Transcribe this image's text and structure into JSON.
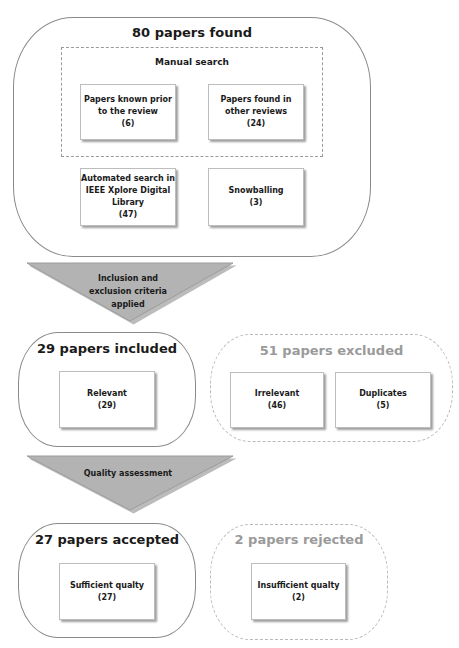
{
  "stage1": {
    "title": "80 papers found",
    "manual_search": {
      "title": "Manual search",
      "items": [
        {
          "line1": "Papers known prior",
          "line2": "to the review",
          "count": "(6)"
        },
        {
          "line1": "Papers found in",
          "line2": "other reviews",
          "count": "(24)"
        }
      ]
    },
    "automated": {
      "line1": "Automated search in",
      "line2": "IEEE Xplore Digital",
      "line3": "Library",
      "count": "(47)"
    },
    "snowballing": {
      "label": "Snowballing",
      "count": "(3)"
    }
  },
  "filter1": {
    "line1": "Inclusion and",
    "line2": "exclusion criteria",
    "line3": "applied"
  },
  "stage2": {
    "included": {
      "title": "29 papers included",
      "items": [
        {
          "label": "Relevant",
          "count": "(29)"
        }
      ]
    },
    "excluded": {
      "title": "51 papers excluded",
      "items": [
        {
          "label": "Irrelevant",
          "count": "(46)"
        },
        {
          "label": "Duplicates",
          "count": "(5)"
        }
      ]
    }
  },
  "filter2": {
    "label": "Quality assessment"
  },
  "stage3": {
    "accepted": {
      "title": "27 papers accepted",
      "items": [
        {
          "label": "Sufficient qualty",
          "count": "(27)"
        }
      ]
    },
    "rejected": {
      "title": "2 papers rejected",
      "items": [
        {
          "label": "Insufficient qualty",
          "count": "(2)"
        }
      ]
    }
  },
  "colors": {
    "triangle": "#b3b3b3",
    "muted_text": "#9a9a9a",
    "border": "#8a8a8a"
  }
}
